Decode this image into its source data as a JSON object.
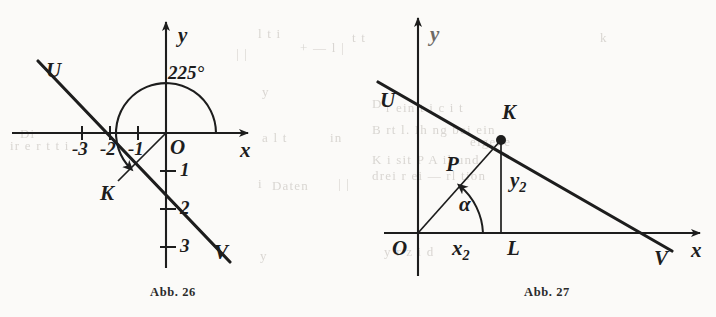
{
  "page": {
    "background_color": "#fbfaf8",
    "ink_color": "#1d1d1d",
    "ghost_color": "#d9d6d2"
  },
  "ghost_text": [
    {
      "text": "l t  i",
      "x": 258,
      "y": 26
    },
    {
      "text": "+  — l  |",
      "x": 300,
      "y": 40
    },
    {
      "text": "| |",
      "x": 236,
      "y": 46
    },
    {
      "text": "t  t",
      "x": 352,
      "y": 30
    },
    {
      "text": "y",
      "x": 262,
      "y": 84
    },
    {
      "text": "a  l   t",
      "x": 262,
      "y": 130
    },
    {
      "text": "in",
      "x": 330,
      "y": 130
    },
    {
      "text": "i",
      "x": 258,
      "y": 176
    },
    {
      "text": "Daten",
      "x": 272,
      "y": 178
    },
    {
      "text": "| |",
      "x": 338,
      "y": 176
    },
    {
      "text": "y",
      "x": 260,
      "y": 248
    },
    {
      "text": "Di",
      "x": 20,
      "y": 126
    },
    {
      "text": "ir e  r  t  t  i",
      "x": 10,
      "y": 138
    },
    {
      "text": "k",
      "x": 600,
      "y": 30
    },
    {
      "text": "D",
      "x": 372,
      "y": 96
    },
    {
      "text": "r  ein  t  i  c  i  t",
      "x": 386,
      "y": 100
    },
    {
      "text": "B    rt  l. Ih ng bei ein",
      "x": 372,
      "y": 122
    },
    {
      "text": "eigene",
      "x": 470,
      "y": 134
    },
    {
      "text": "K  i sit     P   A     il  und",
      "x": 372,
      "y": 152
    },
    {
      "text": "drei  r     ei   — rl  tion",
      "x": 372,
      "y": 168
    },
    {
      "text": "y    r  z   i  d",
      "x": 384,
      "y": 244
    }
  ],
  "figures": [
    {
      "id": "abb-26",
      "caption": "Abb. 26",
      "type": "coordinate-diagram",
      "axes": {
        "x_label": "x",
        "y_label": "y",
        "origin_label": "O"
      },
      "x_ticks": [
        "-3",
        "-2",
        "-1"
      ],
      "y_ticks": [
        "1",
        "2",
        "3"
      ],
      "line": {
        "start_label": "U",
        "end_label": "V"
      },
      "point_label": "K",
      "angle_label": "225°"
    },
    {
      "id": "abb-27",
      "caption": "Abb. 27",
      "type": "coordinate-diagram",
      "axes": {
        "x_label": "x",
        "y_label": "y",
        "origin_label": "O"
      },
      "line": {
        "start_label": "U",
        "end_label": "V"
      },
      "point_label": "K",
      "foot_label": "L",
      "radius_label": "P",
      "angle_label": "α",
      "abscissa_label": "x₂",
      "ordinate_label": "y₂",
      "abscissa_base": "x",
      "abscissa_sub": "2",
      "ordinate_base": "y",
      "ordinate_sub": "2"
    }
  ]
}
